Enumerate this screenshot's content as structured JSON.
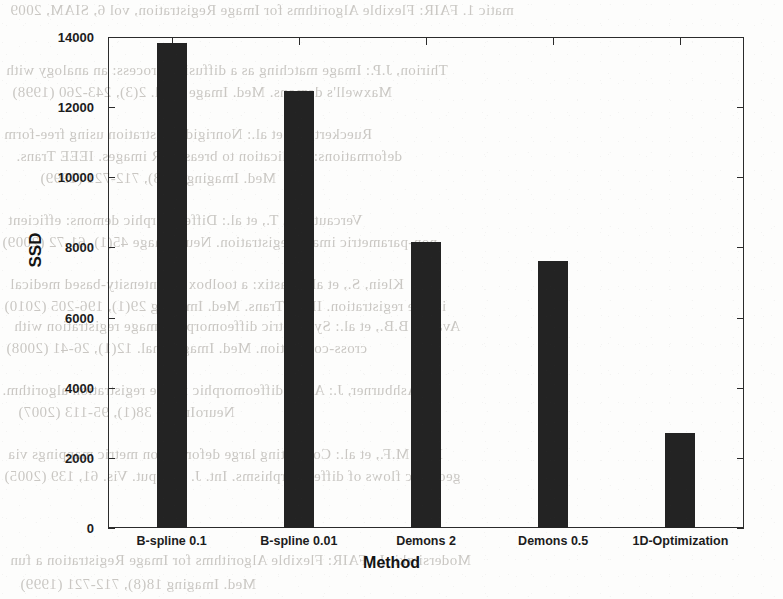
{
  "chart_data": {
    "type": "bar",
    "title": "",
    "xlabel": "Method",
    "ylabel": "SSD",
    "categories": [
      "B-spline 0.1",
      "B-spline 0.01",
      "Demons 2",
      "Demons 0.5",
      "1D-Optimization"
    ],
    "values": [
      13830,
      12450,
      8150,
      7610,
      2710
    ],
    "ylim": [
      0,
      14000
    ],
    "yticks": [
      0,
      2000,
      4000,
      6000,
      8000,
      10000,
      12000,
      14000
    ],
    "ytick_labels": [
      "0",
      "2000",
      "4000",
      "6000",
      "8000",
      "10000",
      "12000",
      "14000"
    ],
    "grid": false,
    "legend": null,
    "bar_color": "#232323",
    "axis_color": "#2b2b2b"
  },
  "background_text": {
    "note": "faint mirrored bleed-through text from the reverse side of the scanned page",
    "lines": [
      "matic 1. FAIR: Flexible Algorithms for Image Registration, vol 6, SIAM, 2009",
      "Modersitzki, J.: FAIR: Flexible Algorithms for Image Registration a fun",
      "Thirion, J.P.: Image matching as a diffusion process: an analogy with",
      "Maxwell's demons. Med. Image Anal. 2(3), 243-260 (1998)",
      "Rueckert, D., et al.: Nonrigid registration using free-form",
      "deformations: application to breast MR images. IEEE Trans.",
      "Med. Imaging 18(8), 712-721 (1999)",
      "Vercauteren, T., et al.: Diffeomorphic demons: efficient",
      "non-parametric image registration. NeuroImage 45(1), 61-72 (2009)",
      "Klein, S., et al.: elastix: a toolbox for intensity-based medical",
      "image registration. IEEE Trans. Med. Imaging 29(1), 196-205 (2010)",
      "Avants, B.B., et al.: Symmetric diffeomorphic image registration with",
      "cross-correlation. Med. Image Anal. 12(1), 26-41 (2008)",
      "Ashburner, J.: A fast diffeomorphic image registration algorithm.",
      "NeuroImage 38(1), 95-113 (2007)",
      "Beg, M.F., et al.: Computing large deformation metric mappings via",
      "geodesic flows of diffeomorphisms. Int. J. Comput. Vis. 61, 139 (2005)"
    ]
  }
}
